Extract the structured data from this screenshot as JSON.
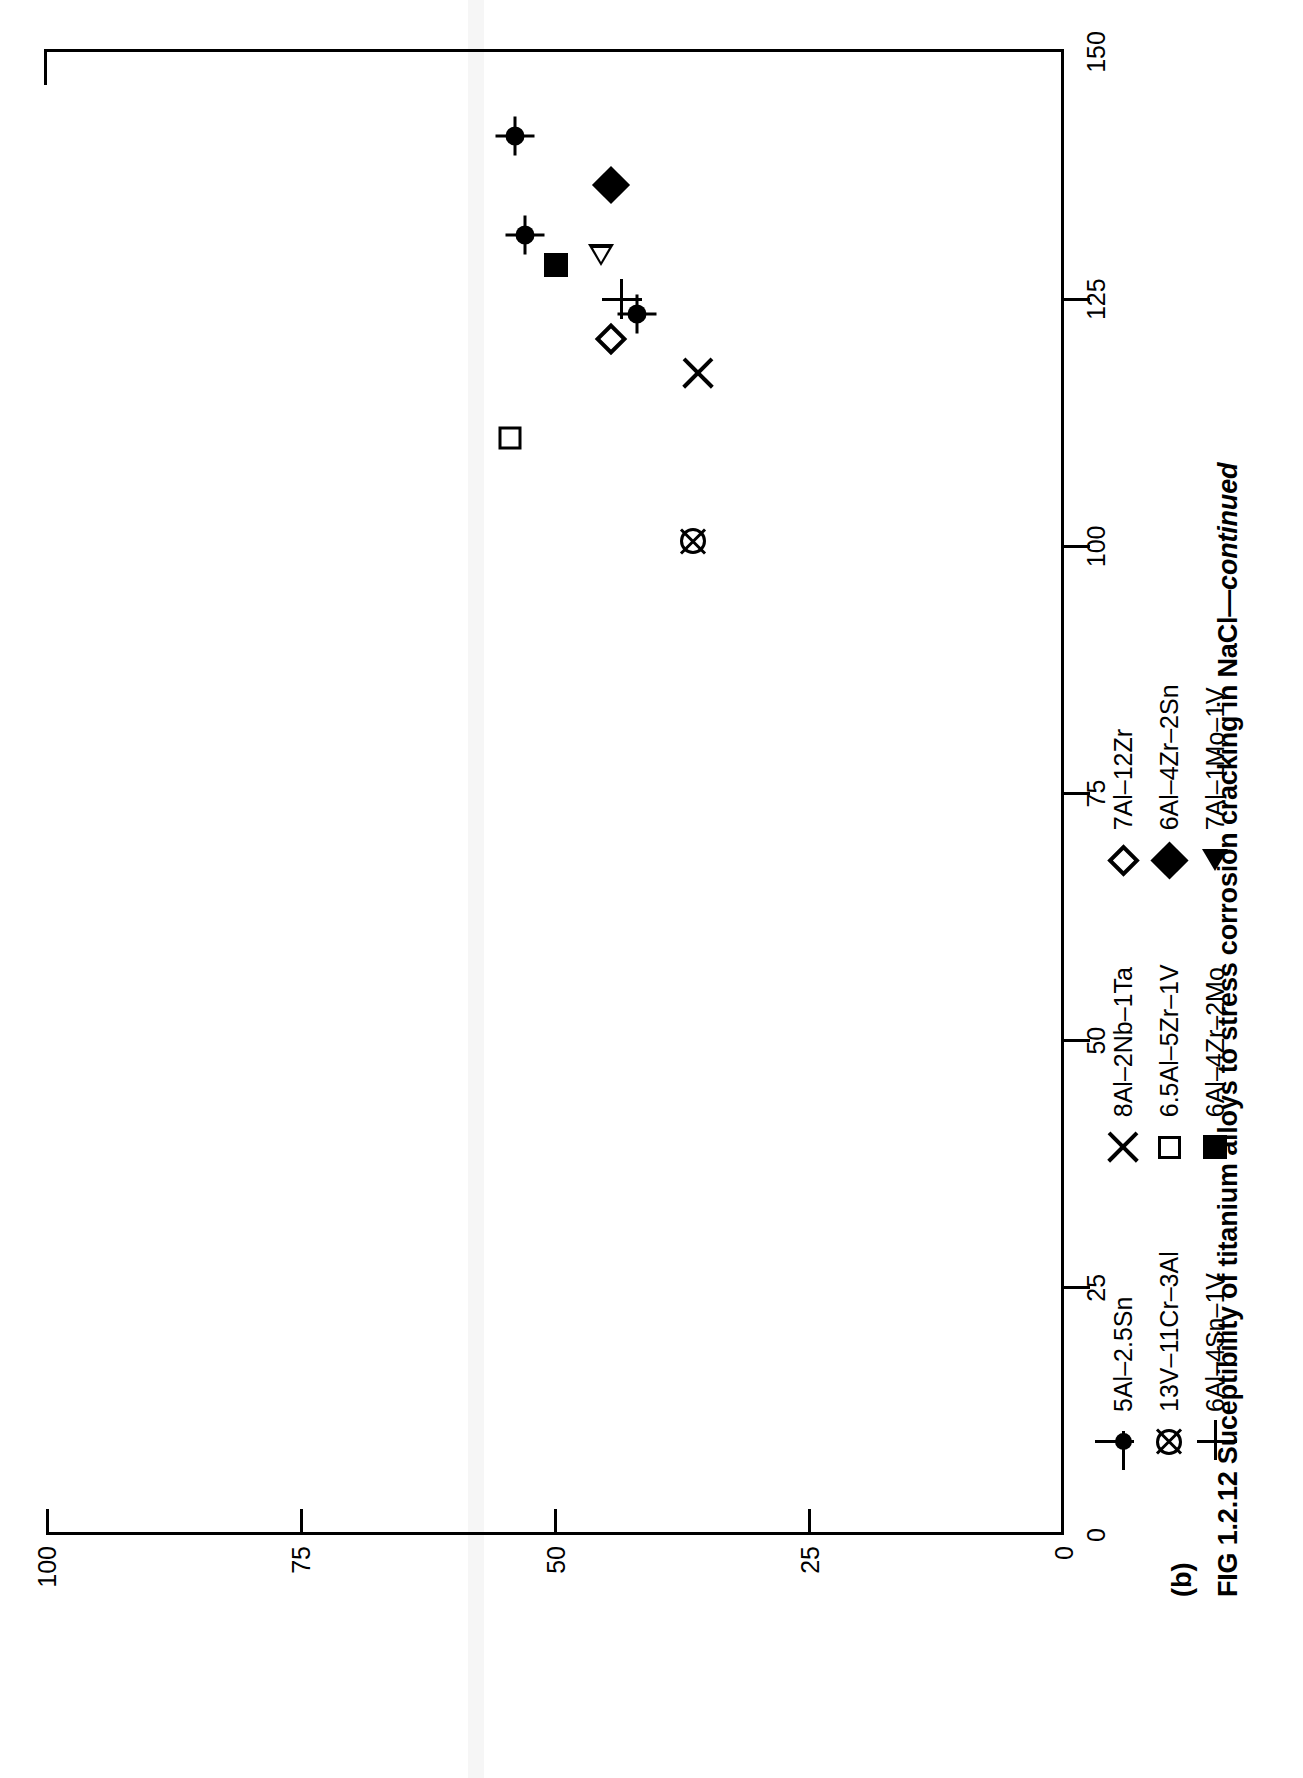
{
  "figure": {
    "panel_letter": "(b)",
    "caption_main": "FIG 1.2.12 Suceptibility of titanium alloys to stress corrosion cracking in NaCl",
    "caption_dash": "—",
    "caption_continued": "continued"
  },
  "chart_data": {
    "type": "scatter",
    "title": "",
    "xlabel": "",
    "ylabel": "",
    "xlim": [
      0,
      150
    ],
    "ylim": [
      0,
      100
    ],
    "xticks": [
      0,
      25,
      50,
      75,
      100,
      125,
      150
    ],
    "yticks": [
      0,
      25,
      50,
      75,
      100
    ],
    "xticklabels": [
      "0",
      "25",
      "50",
      "75",
      "100",
      "125",
      "150"
    ],
    "yticklabels": [
      "0",
      "25",
      "50",
      "75",
      "100"
    ],
    "grid": false,
    "legend_position": "below-axes",
    "series": [
      {
        "name": "5Al–2.5Sn",
        "marker": "filled-circle-crosshair",
        "points": [
          {
            "x": 141.5,
            "y": 54
          },
          {
            "x": 131.5,
            "y": 53
          },
          {
            "x": 123.5,
            "y": 42
          }
        ]
      },
      {
        "name": "13V–11Cr–3Al",
        "marker": "crossed-circle",
        "points": [
          {
            "x": 100.5,
            "y": 36.5
          }
        ]
      },
      {
        "name": "6Al–4Sn–1V",
        "marker": "plus",
        "points": [
          {
            "x": 125,
            "y": 43.5
          }
        ]
      },
      {
        "name": "8Al–2Nb–1Ta",
        "marker": "x-cross",
        "points": [
          {
            "x": 117.5,
            "y": 36
          }
        ]
      },
      {
        "name": "6.5Al–5Zr–1V",
        "marker": "open-square",
        "points": [
          {
            "x": 111,
            "y": 54.5
          }
        ]
      },
      {
        "name": "6Al–4Zr–2Mo",
        "marker": "filled-square",
        "points": [
          {
            "x": 128.5,
            "y": 50
          }
        ]
      },
      {
        "name": "7Al–12Zr",
        "marker": "open-diamond",
        "points": [
          {
            "x": 121,
            "y": 44.5
          }
        ]
      },
      {
        "name": "6Al–4Zr–2Sn",
        "marker": "filled-diamond",
        "points": [
          {
            "x": 136.5,
            "y": 44.5
          }
        ]
      },
      {
        "name": "7Al–1Mo–1V",
        "marker": "open-triangle-left",
        "points": [
          {
            "x": 129.5,
            "y": 45.5
          }
        ]
      }
    ]
  },
  "legend": {
    "columns": [
      {
        "rows": [
          {
            "marker": "filled-circle-crosshair",
            "label": "5Al–2.5Sn"
          },
          {
            "marker": "crossed-circle",
            "label": "13V–11Cr–3Al"
          },
          {
            "marker": "plus",
            "label": "6Al–4Sn–1V"
          }
        ]
      },
      {
        "rows": [
          {
            "marker": "x-cross",
            "label": "8Al–2Nb–1Ta"
          },
          {
            "marker": "open-square",
            "label": "6.5Al–5Zr–1V"
          },
          {
            "marker": "filled-square",
            "label": "6Al–4Zr–2Mo"
          }
        ]
      },
      {
        "rows": [
          {
            "marker": "open-diamond",
            "label": "7Al–12Zr"
          },
          {
            "marker": "filled-diamond",
            "label": "6Al–4Zr–2Sn"
          },
          {
            "marker": "open-triangle-left",
            "label": "7Al–1Mo–1V"
          }
        ]
      }
    ]
  }
}
